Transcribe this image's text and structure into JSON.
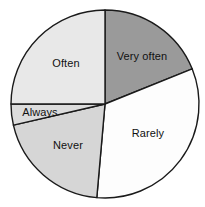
{
  "chart_data": {
    "type": "pie",
    "title": "",
    "subtitle": "",
    "xlabel": "",
    "ylabel": "",
    "legend_position": "none",
    "grid": false,
    "labels_inside_slices": true,
    "start_angle_deg": 0,
    "direction": "clockwise",
    "categories": [
      "Very often",
      "Rarely",
      "Never",
      "Always",
      "Often"
    ],
    "values": [
      19,
      32.5,
      20,
      3.5,
      25
    ],
    "units": "percent",
    "slices": [
      {
        "label": "Very often",
        "value": 19,
        "start_angle": 0,
        "end_angle": 68,
        "color": "#9a9a9a",
        "label_x": 142,
        "label_y": 57
      },
      {
        "label": "Rarely",
        "value": 32.5,
        "start_angle": 68,
        "end_angle": 185,
        "color": "#fdfdfd",
        "label_x": 148,
        "label_y": 134
      },
      {
        "label": "Never",
        "value": 20,
        "start_angle": 185,
        "end_angle": 257,
        "color": "#d6d6d6",
        "label_x": 68,
        "label_y": 146
      },
      {
        "label": "Always",
        "value": 3.5,
        "start_angle": 257,
        "end_angle": 270,
        "color": "#dcdcdc",
        "label_x": 40,
        "label_y": 113
      },
      {
        "label": "Often",
        "value": 25,
        "start_angle": 270,
        "end_angle": 360,
        "color": "#e8e8e8",
        "label_x": 66,
        "label_y": 64
      }
    ],
    "geometry": {
      "center_x": 105,
      "center_y": 104,
      "radius": 94
    },
    "style": {
      "outline_color": "#1a1a1a",
      "background": "#ffffff"
    }
  }
}
